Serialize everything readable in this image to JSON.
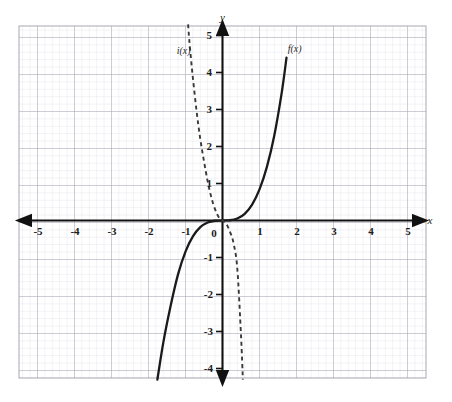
{
  "figure": {
    "title_ghost": "",
    "background_color": "#ffffff",
    "grid_minor_color": "#d9d9e0",
    "grid_major_color": "#9a9aa6",
    "axis_color": "#111111",
    "curve_color": "#1a1a1a"
  },
  "axes": {
    "x_label": "x",
    "y_label": "y",
    "x_ticks": [
      "-5",
      "-4",
      "-3",
      "-2",
      "-1",
      "0",
      "1",
      "2",
      "3",
      "4",
      "5"
    ],
    "y_ticks": [
      "5",
      "4",
      "3",
      "2",
      "1",
      "-1",
      "-2",
      "-3",
      "-4"
    ],
    "origin_label": "0"
  },
  "curves": [
    {
      "name": "f",
      "label": "f(x)",
      "style": "solid",
      "description": "increasing cubic through origin"
    },
    {
      "name": "i",
      "label": "i(x)",
      "style": "dashed",
      "description": "decreasing cubic through origin, reflection of f"
    }
  ],
  "chart_data": {
    "type": "line",
    "title": "",
    "xlabel": "x",
    "ylabel": "y",
    "xlim": [
      -5.5,
      5.5
    ],
    "ylim": [
      -4.7,
      5.4
    ],
    "grid": true,
    "legend": "inline-labels",
    "xticks": [
      -5,
      -4,
      -3,
      -2,
      -1,
      0,
      1,
      2,
      3,
      4,
      5
    ],
    "yticks": [
      -4,
      -3,
      -2,
      -1,
      1,
      2,
      3,
      4,
      5
    ],
    "series": [
      {
        "name": "f(x)",
        "style": "solid",
        "label_at": [
          1.95,
          4.55
        ],
        "x": [
          -1.76,
          -1.6,
          -1.4,
          -1.2,
          -1.0,
          -0.8,
          -0.6,
          -0.4,
          -0.2,
          0.0,
          0.2,
          0.4,
          0.6,
          0.8,
          1.0,
          1.2,
          1.4,
          1.6,
          1.73
        ],
        "y": [
          -4.3,
          -3.3,
          -2.3,
          -1.45,
          -0.84,
          -0.43,
          -0.18,
          -0.053,
          -0.0067,
          0.0,
          0.0067,
          0.053,
          0.18,
          0.43,
          0.84,
          1.45,
          2.3,
          3.45,
          4.4
        ]
      },
      {
        "name": "i(x)",
        "style": "dashed",
        "label_at": [
          -1.05,
          4.5
        ],
        "x": [
          -0.93,
          -0.9,
          -0.85,
          -0.8,
          -0.7,
          -0.6,
          -0.5,
          -0.4,
          -0.3,
          -0.2,
          -0.1,
          0.0,
          0.1,
          0.2,
          0.3,
          0.4,
          0.5,
          0.55
        ],
        "y": [
          5.3,
          4.9,
          4.35,
          3.85,
          2.95,
          2.2,
          1.6,
          1.05,
          0.62,
          0.3,
          0.09,
          0.0,
          -0.09,
          -0.3,
          -0.62,
          -1.3,
          -3.1,
          -4.3
        ]
      }
    ]
  }
}
